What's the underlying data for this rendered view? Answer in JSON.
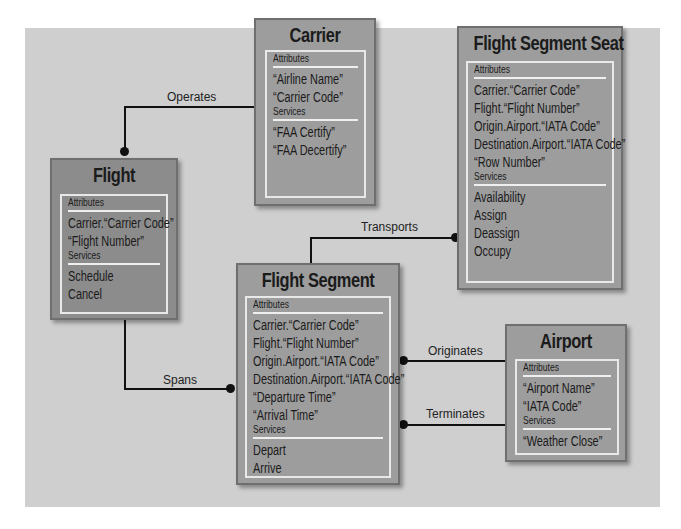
{
  "entities": {
    "carrier": {
      "title": "Carrier",
      "attributes_label": "Attributes",
      "attributes": [
        "“Airline Name”",
        "“Carrier Code”"
      ],
      "services_label": "Services",
      "services": [
        "“FAA Certify”",
        "“FAA Decertify”"
      ]
    },
    "flight": {
      "title": "Flight",
      "attributes_label": "Attributes",
      "attributes": [
        "Carrier.“Carrier Code”",
        "“Flight Number”"
      ],
      "services_label": "Services",
      "services": [
        "Schedule",
        "Cancel"
      ]
    },
    "flight_segment_seat": {
      "title": "Flight Segment Seat",
      "attributes_label": "Attributes",
      "attributes": [
        "Carrier.“Carrier Code”",
        "Flight.“Flight Number”",
        "Origin.Airport.“IATA Code”",
        "Destination.Airport.“IATA Code”",
        "“Row Number”"
      ],
      "services_label": "Services",
      "services": [
        "Availability",
        "Assign",
        "Deassign",
        "Occupy"
      ]
    },
    "flight_segment": {
      "title": "Flight Segment",
      "attributes_label": "Attributes",
      "attributes": [
        "Carrier.“Carrier Code”",
        "Flight.“Flight Number”",
        "Origin.Airport.“IATA Code”",
        "Destination.Airport.“IATA Code”",
        "“Departure Time”",
        "“Arrival Time”"
      ],
      "services_label": "Services",
      "services": [
        "Depart",
        "Arrive"
      ]
    },
    "airport": {
      "title": "Airport",
      "attributes_label": "Attributes",
      "attributes": [
        "“Airport Name”",
        "“IATA Code”"
      ],
      "services_label": "Services",
      "services": [
        "“Weather Close”"
      ]
    }
  },
  "relationships": {
    "operates": "Operates",
    "transports": "Transports",
    "spans": "Spans",
    "originates": "Originates",
    "terminates": "Terminates"
  },
  "colors": {
    "panel": "#cfcfcf",
    "entity_fill": "#9d9d9d",
    "entity_border": "#6f6f6f",
    "inner_border": "#e8e8e8",
    "connector": "#111111"
  }
}
